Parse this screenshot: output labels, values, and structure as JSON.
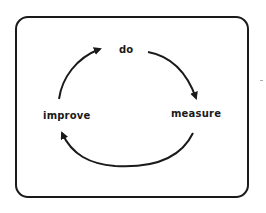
{
  "diagram": {
    "type": "cycle",
    "nodes": [
      {
        "id": "do",
        "label": "do"
      },
      {
        "id": "measure",
        "label": "measure"
      },
      {
        "id": "improve",
        "label": "improve"
      }
    ],
    "edges": [
      {
        "from": "do",
        "to": "measure"
      },
      {
        "from": "measure",
        "to": "improve"
      },
      {
        "from": "improve",
        "to": "do"
      }
    ],
    "colors": {
      "stroke": "#1a1a1a",
      "background": "#ffffff"
    }
  }
}
